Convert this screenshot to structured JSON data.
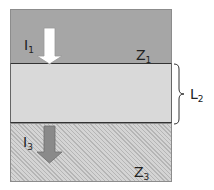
{
  "layers": [
    {
      "id": "z1",
      "label": "Z",
      "sub": "1",
      "fill": "#a6a6a6"
    },
    {
      "id": "l2",
      "label": "L",
      "sub": "2",
      "fill": "#d9d9d9"
    },
    {
      "id": "z3",
      "label": "Z",
      "sub": "3",
      "fill": "#c8c8c8",
      "pattern": "diagonal-hatch"
    }
  ],
  "arrows": [
    {
      "label": "I",
      "sub": "1",
      "fill": "#ffffff",
      "direction": "down"
    },
    {
      "label": "I",
      "sub": "3",
      "fill": "#8a8a8a",
      "direction": "down"
    }
  ]
}
